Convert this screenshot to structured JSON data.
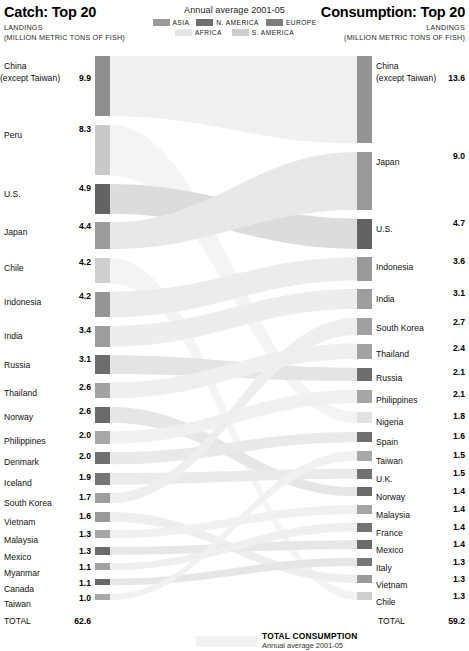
{
  "header": {
    "left": {
      "title": "Catch: Top 20",
      "sub1": "LANDINGS",
      "sub2": "(MILLION METRIC TONS OF FISH)"
    },
    "right": {
      "title": "Consumption: Top 20",
      "sub1": "LANDINGS",
      "sub2": "(MILLION METRIC TONS OF FISH)"
    },
    "middle": {
      "annotation": "Annual average 2001-05",
      "legend": [
        {
          "label": "ASIA",
          "color": "#9a9a9a"
        },
        {
          "label": "N. AMERICA",
          "color": "#6f6f6f"
        },
        {
          "label": "EUROPE",
          "color": "#7d7d7d"
        },
        {
          "label": "AFRICA",
          "color": "#e6e6e6"
        },
        {
          "label": "S. AMERICA",
          "color": "#cdcdcd"
        }
      ]
    }
  },
  "footer": {
    "line1": "TOTAL CONSUMPTION",
    "line2": "Annual average 2001-05"
  },
  "chart_data": {
    "type": "bar",
    "subtitle": "Annual average 2001-05",
    "units": "million metric tons of fish",
    "xlabel": "",
    "ylabel": "",
    "regions": {
      "ASIA": "#9a9a9a",
      "N. AMERICA": "#6f6f6f",
      "EUROPE": "#7d7d7d",
      "AFRICA": "#e6e6e6",
      "S. AMERICA": "#cdcdcd"
    },
    "catch": {
      "label": "Catch: Top 20",
      "total_label": "TOTAL",
      "total_value": "62.6",
      "items": [
        {
          "name": "China",
          "name2": "(except Taiwan)",
          "value": "9.9",
          "v": 9.9,
          "region": "ASIA",
          "color": "#8e8e8e"
        },
        {
          "name": "Peru",
          "name2": "",
          "value": "8.3",
          "v": 8.3,
          "region": "S. AMERICA",
          "color": "#c9c9c9"
        },
        {
          "name": "U.S.",
          "name2": "",
          "value": "4.9",
          "v": 4.9,
          "region": "N. AMERICA",
          "color": "#636363"
        },
        {
          "name": "Japan",
          "name2": "",
          "value": "4.4",
          "v": 4.4,
          "region": "ASIA",
          "color": "#9b9b9b"
        },
        {
          "name": "Chile",
          "name2": "",
          "value": "4.2",
          "v": 4.2,
          "region": "S. AMERICA",
          "color": "#cfcfcf"
        },
        {
          "name": "Indonesia",
          "name2": "",
          "value": "4.2",
          "v": 4.2,
          "region": "ASIA",
          "color": "#969696"
        },
        {
          "name": "India",
          "name2": "",
          "value": "3.4",
          "v": 3.4,
          "region": "ASIA",
          "color": "#9d9d9d"
        },
        {
          "name": "Russia",
          "name2": "",
          "value": "3.1",
          "v": 3.1,
          "region": "EUROPE",
          "color": "#6d6d6d"
        },
        {
          "name": "Thailand",
          "name2": "",
          "value": "2.6",
          "v": 2.6,
          "region": "ASIA",
          "color": "#a3a3a3"
        },
        {
          "name": "Norway",
          "name2": "",
          "value": "2.6",
          "v": 2.6,
          "region": "EUROPE",
          "color": "#6a6a6a"
        },
        {
          "name": "Philippines",
          "name2": "",
          "value": "2.0",
          "v": 2.0,
          "region": "ASIA",
          "color": "#a8a8a8"
        },
        {
          "name": "Denmark",
          "name2": "",
          "value": "2.0",
          "v": 2.0,
          "region": "EUROPE",
          "color": "#707070"
        },
        {
          "name": "Iceland",
          "name2": "",
          "value": "1.9",
          "v": 1.9,
          "region": "EUROPE",
          "color": "#767676"
        },
        {
          "name": "South Korea",
          "name2": "",
          "value": "1.7",
          "v": 1.7,
          "region": "ASIA",
          "color": "#9e9e9e"
        },
        {
          "name": "Vietnam",
          "name2": "",
          "value": "1.6",
          "v": 1.6,
          "region": "ASIA",
          "color": "#9a9a9a"
        },
        {
          "name": "Malaysia",
          "name2": "",
          "value": "1.3",
          "v": 1.3,
          "region": "ASIA",
          "color": "#a5a5a5"
        },
        {
          "name": "Mexico",
          "name2": "",
          "value": "1.3",
          "v": 1.3,
          "region": "N. AMERICA",
          "color": "#6b6b6b"
        },
        {
          "name": "Myanmar",
          "name2": "",
          "value": "1.1",
          "v": 1.1,
          "region": "ASIA",
          "color": "#a0a0a0"
        },
        {
          "name": "Canada",
          "name2": "",
          "value": "1.1",
          "v": 1.1,
          "region": "N. AMERICA",
          "color": "#676767"
        },
        {
          "name": "Taiwan",
          "name2": "",
          "value": "1.0",
          "v": 1.0,
          "region": "ASIA",
          "color": "#a9a9a9"
        }
      ]
    },
    "consumption": {
      "label": "Consumption: Top 20",
      "total_label": "TOTAL",
      "total_value": "59.2",
      "items": [
        {
          "name": "China",
          "name2": "(except Taiwan)",
          "value": "13.6",
          "v": 13.6,
          "region": "ASIA",
          "color": "#949494"
        },
        {
          "name": "Japan",
          "name2": "",
          "value": "9.0",
          "v": 9.0,
          "region": "ASIA",
          "color": "#999999"
        },
        {
          "name": "U.S.",
          "name2": "",
          "value": "4.7",
          "v": 4.7,
          "region": "N. AMERICA",
          "color": "#636363"
        },
        {
          "name": "Indonesia",
          "name2": "",
          "value": "3.6",
          "v": 3.6,
          "region": "ASIA",
          "color": "#9a9a9a"
        },
        {
          "name": "India",
          "name2": "",
          "value": "3.1",
          "v": 3.1,
          "region": "ASIA",
          "color": "#9d9d9d"
        },
        {
          "name": "South Korea",
          "name2": "",
          "value": "2.7",
          "v": 2.7,
          "region": "ASIA",
          "color": "#a0a0a0"
        },
        {
          "name": "Thailand",
          "name2": "",
          "value": "2.4",
          "v": 2.4,
          "region": "ASIA",
          "color": "#a3a3a3"
        },
        {
          "name": "Russia",
          "name2": "",
          "value": "2.1",
          "v": 2.1,
          "region": "EUROPE",
          "color": "#6d6d6d"
        },
        {
          "name": "Philippines",
          "name2": "",
          "value": "2.1",
          "v": 2.1,
          "region": "ASIA",
          "color": "#a6a6a6"
        },
        {
          "name": "Nigeria",
          "name2": "",
          "value": "1.8",
          "v": 1.8,
          "region": "AFRICA",
          "color": "#e2e2e2"
        },
        {
          "name": "Spain",
          "name2": "",
          "value": "1.6",
          "v": 1.6,
          "region": "EUROPE",
          "color": "#6e6e6e"
        },
        {
          "name": "Taiwan",
          "name2": "",
          "value": "1.5",
          "v": 1.5,
          "region": "ASIA",
          "color": "#a9a9a9"
        },
        {
          "name": "U.K.",
          "name2": "",
          "value": "1.5",
          "v": 1.5,
          "region": "EUROPE",
          "color": "#717171"
        },
        {
          "name": "Norway",
          "name2": "",
          "value": "1.4",
          "v": 1.4,
          "region": "EUROPE",
          "color": "#6a6a6a"
        },
        {
          "name": "Malaysia",
          "name2": "",
          "value": "1.4",
          "v": 1.4,
          "region": "ASIA",
          "color": "#a5a5a5"
        },
        {
          "name": "France",
          "name2": "",
          "value": "1.4",
          "v": 1.4,
          "region": "EUROPE",
          "color": "#747474"
        },
        {
          "name": "Mexico",
          "name2": "",
          "value": "1.4",
          "v": 1.4,
          "region": "N. AMERICA",
          "color": "#6b6b6b"
        },
        {
          "name": "Italy",
          "name2": "",
          "value": "1.3",
          "v": 1.3,
          "region": "EUROPE",
          "color": "#777777"
        },
        {
          "name": "Vietnam",
          "name2": "",
          "value": "1.3",
          "v": 1.3,
          "region": "ASIA",
          "color": "#9a9a9a"
        },
        {
          "name": "Chile",
          "name2": "",
          "value": "1.3",
          "v": 1.3,
          "region": "S. AMERICA",
          "color": "#cfcfcf"
        }
      ]
    },
    "flows": [
      {
        "from": "China",
        "to": "China",
        "value": 9.9,
        "color": "#f0f0f0"
      },
      {
        "from": "Peru",
        "to": "Nigeria",
        "value": 8.3,
        "color": "#f4f4f4"
      },
      {
        "from": "U.S.",
        "to": "U.S.",
        "value": 4.9,
        "color": "#dcdcdc"
      },
      {
        "from": "Japan",
        "to": "Japan",
        "value": 4.4,
        "color": "#e8e8e8"
      },
      {
        "from": "Chile",
        "to": "Chile",
        "value": 4.2,
        "color": "#f4f4f4"
      },
      {
        "from": "Indonesia",
        "to": "Indonesia",
        "value": 4.2,
        "color": "#ececec"
      },
      {
        "from": "India",
        "to": "India",
        "value": 3.4,
        "color": "#ededed"
      },
      {
        "from": "Russia",
        "to": "Russia",
        "value": 3.1,
        "color": "#e4e4e4"
      },
      {
        "from": "Thailand",
        "to": "Thailand",
        "value": 2.6,
        "color": "#efefef"
      },
      {
        "from": "Norway",
        "to": "Norway",
        "value": 2.6,
        "color": "#e6e6e6"
      },
      {
        "from": "Philippines",
        "to": "Philippines",
        "value": 2.0,
        "color": "#f0f0f0"
      },
      {
        "from": "Denmark",
        "to": "Spain",
        "value": 2.0,
        "color": "#e9e9e9"
      },
      {
        "from": "Iceland",
        "to": "U.K.",
        "value": 1.9,
        "color": "#eaeaea"
      },
      {
        "from": "South Korea",
        "to": "South Korea",
        "value": 1.7,
        "color": "#eeeeee"
      },
      {
        "from": "Vietnam",
        "to": "Vietnam",
        "value": 1.6,
        "color": "#eeeeee"
      },
      {
        "from": "Malaysia",
        "to": "Malaysia",
        "value": 1.3,
        "color": "#f0f0f0"
      },
      {
        "from": "Mexico",
        "to": "Mexico",
        "value": 1.3,
        "color": "#e7e7e7"
      },
      {
        "from": "Myanmar",
        "to": "France",
        "value": 1.1,
        "color": "#efefef"
      },
      {
        "from": "Canada",
        "to": "Italy",
        "value": 1.1,
        "color": "#e6e6e6"
      },
      {
        "from": "Taiwan",
        "to": "Taiwan",
        "value": 1.0,
        "color": "#f1f1f1"
      }
    ]
  }
}
